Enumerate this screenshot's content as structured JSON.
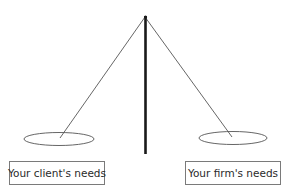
{
  "diagram": {
    "type": "balance-scale",
    "colors": {
      "pole": "#1a1a1a",
      "strings": "#555555",
      "pans": "#555555",
      "box_border": "#7a7a7a",
      "text": "#2a2a2a"
    },
    "left_pan": {
      "label": "Your client's needs"
    },
    "right_pan": {
      "label": "Your firm's needs"
    }
  }
}
